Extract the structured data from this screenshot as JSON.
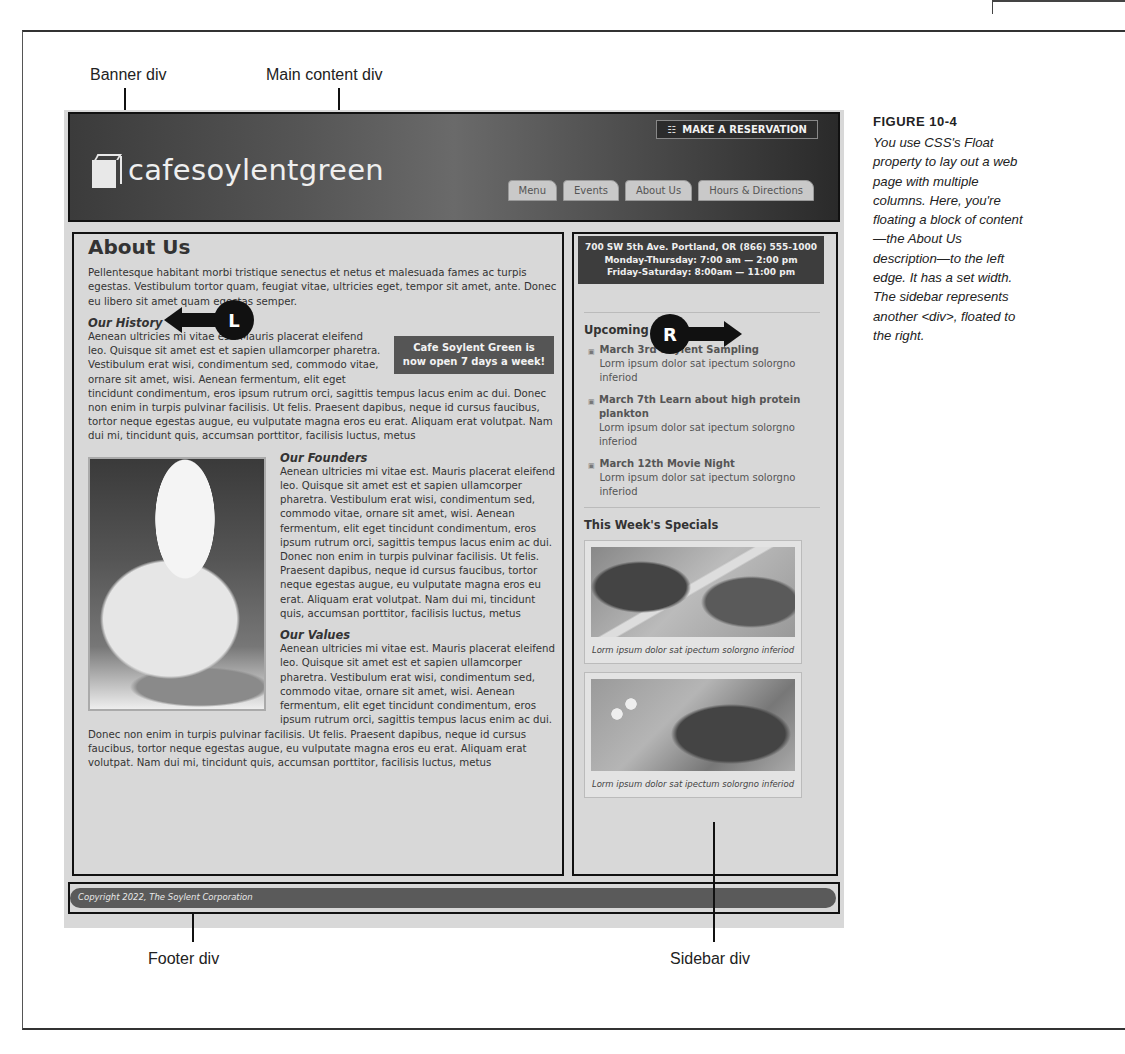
{
  "figure": {
    "title": "FIGURE 10-4",
    "caption": "You use CSS's Float property to lay out a web page with multiple columns. Here, you're floating a block of content—the About Us description—to the left edge. It has a set width. The sidebar represents another <div>, floated to the right."
  },
  "callouts": {
    "banner": "Banner div",
    "main": "Main content div",
    "footer": "Footer div",
    "sidebar": "Sidebar div",
    "left_marker": "L",
    "right_marker": "R"
  },
  "banner": {
    "logo_text": "cafesoylentgreen",
    "reservation_label": "MAKE A RESERVATION",
    "nav": [
      {
        "label": "Menu"
      },
      {
        "label": "Events"
      },
      {
        "label": "About Us"
      },
      {
        "label": "Hours & Directions"
      }
    ]
  },
  "main": {
    "title": "About Us",
    "intro": "Pellentesque habitant morbi tristique senectus et netus et malesuada fames ac turpis egestas. Vestibulum tortor quam, feugiat vitae, ultricies eget, tempor sit amet, ante. Donec eu libero sit amet quam egestas semper.",
    "notice": "Cafe Soylent Green is now open 7 days a week!",
    "sections": [
      {
        "heading": "Our History",
        "body": "Aenean ultricies mi vitae est. Mauris placerat eleifend leo. Quisque sit amet est et sapien ullamcorper pharetra. Vestibulum erat wisi, condimentum sed, commodo vitae, ornare sit amet, wisi. Aenean fermentum, elit eget tincidunt condimentum, eros ipsum rutrum orci, sagittis tempus lacus enim ac dui. Donec non enim in turpis pulvinar facilisis. Ut felis. Praesent dapibus, neque id cursus faucibus, tortor neque egestas augue, eu vulputate magna eros eu erat. Aliquam erat volutpat. Nam dui mi, tincidunt quis, accumsan porttitor, facilisis luctus, metus"
      },
      {
        "heading": "Our Founders",
        "body": "Aenean ultricies mi vitae est. Mauris placerat eleifend leo. Quisque sit amet est et sapien ullamcorper pharetra. Vestibulum erat wisi, condimentum sed, commodo vitae, ornare sit amet, wisi. Aenean fermentum, elit eget tincidunt condimentum, eros ipsum rutrum orci, sagittis tempus lacus enim ac dui. Donec non enim in turpis pulvinar facilisis. Ut felis. Praesent dapibus, neque id cursus faucibus, tortor neque egestas augue, eu vulputate magna eros eu erat. Aliquam erat volutpat. Nam dui mi, tincidunt quis, accumsan porttitor, facilisis luctus, metus"
      },
      {
        "heading": "Our Values",
        "body": "Aenean ultricies mi vitae est. Mauris placerat eleifend leo. Quisque sit amet est et sapien ullamcorper pharetra. Vestibulum erat wisi, condimentum sed, commodo vitae, ornare sit amet, wisi. Aenean fermentum, elit eget tincidunt condimentum, eros ipsum rutrum orci, sagittis tempus lacus enim ac dui. Donec non enim in turpis pulvinar facilisis. Ut felis. Praesent dapibus, neque id cursus faucibus, tortor neque egestas augue, eu vulputate magna eros eu erat. Aliquam erat volutpat. Nam dui mi, tincidunt quis, accumsan porttitor, facilisis luctus, metus"
      }
    ]
  },
  "sidebar": {
    "address": "700 SW 5th Ave. Portland, OR  (866) 555-1000",
    "hours_weekday": "Monday-Thursday: 7:00 am — 2:00 pm",
    "hours_weekend": "Friday-Saturday: 8:00am — 11:00 pm",
    "events_heading": "Upcoming Events",
    "events": [
      {
        "title": "March 3rd Soylent Sampling",
        "desc": "Lorm ipsum dolor sat ipectum solorgno inferiod"
      },
      {
        "title": "March 7th Learn about high protein plankton",
        "desc": "Lorm ipsum dolor sat ipectum solorgno inferiod"
      },
      {
        "title": "March 12th Movie Night",
        "desc": "Lorm ipsum dolor sat ipectum solorgno inferiod"
      }
    ],
    "specials_heading": "This Week's Specials",
    "specials": [
      {
        "caption": "Lorm ipsum dolor sat ipectum solorgno inferiod"
      },
      {
        "caption": "Lorm ipsum dolor sat ipectum solorgno inferiod"
      }
    ]
  },
  "footer": {
    "copyright": "Copyright 2022, The Soylent Corporation"
  }
}
